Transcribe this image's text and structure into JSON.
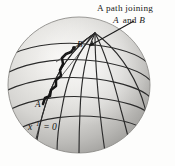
{
  "figure": {
    "title_caption_line1": "A path joining",
    "caption_line2_italic_a": "A",
    "caption_line2_and": " and ",
    "caption_line2_italic_b": "B",
    "point_a_label": "A",
    "point_b_label": "B",
    "axis_label_base": "x",
    "axis_label_superscript": "1",
    "axis_label_value": " = 0",
    "colors": {
      "background": "#fdfdfc",
      "sphere_light": "#f2f1ef",
      "sphere_mid": "#d3d2cf",
      "sphere_dark": "#a5a4a1",
      "grid_line": "#2b2b2b",
      "path_line": "#151515",
      "text": "#1a1a1a"
    },
    "geometry": {
      "sphere_center_x": 79,
      "sphere_center_y": 85,
      "sphere_radius_x": 71,
      "sphere_radius_y": 68,
      "pole_x": 95,
      "pole_y": 33,
      "point_a_x": 43,
      "point_a_y": 104,
      "point_b_x": 73,
      "point_b_y": 48,
      "arrow_tip_x": 88,
      "arrow_tip_y": 46,
      "arrow_tail_x": 134,
      "arrow_tail_y": 21
    },
    "elements": {
      "latitude_count": 5,
      "meridian_count": 6,
      "path_type": "zigzag",
      "sphere_shading": "radial-highlight-upper-left"
    }
  }
}
